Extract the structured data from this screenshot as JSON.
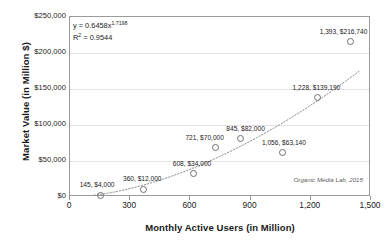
{
  "chart_data": {
    "type": "scatter",
    "title": "",
    "xlabel": "Monthly Active Users (in Million)",
    "ylabel": "Market Value (in Million $)",
    "xlim": [
      0,
      1500
    ],
    "ylim": [
      0,
      250000
    ],
    "xticks": [
      "0",
      "300",
      "600",
      "900",
      "1,200",
      "1,500"
    ],
    "xtick_values": [
      0,
      300,
      600,
      900,
      1200,
      1500
    ],
    "yticks": [
      "$0",
      "$50,000",
      "$100,000",
      "$150,000",
      "$200,000",
      "$250,000"
    ],
    "ytick_values": [
      0,
      50000,
      100000,
      150000,
      200000,
      250000
    ],
    "grid": "horizontal",
    "legend": "none",
    "x": [
      145,
      360,
      608,
      721,
      845,
      1056,
      1228,
      1393
    ],
    "y": [
      4000,
      12000,
      34000,
      70000,
      82000,
      63140,
      139190,
      216740
    ],
    "point_labels": [
      "145, $4,000",
      "360, $12,000",
      "608, $34,000",
      "721, $70,000",
      "845, $82,000",
      "1,056, $63,140",
      "1,228, $139,190",
      "1,393, $216,740"
    ],
    "trendline": {
      "type": "power",
      "coefficient": 0.6458,
      "exponent": 1.7198,
      "equation": "y = 0.6458x",
      "equation_exponent": "1.7198",
      "r_squared_label": "R",
      "r_squared_sup": "2",
      "r_squared_value": " = 0.9544",
      "style": "dotted"
    },
    "annotations": {
      "attribution": "Organic Media Lab, 2015"
    },
    "colors": {
      "point_stroke": "#6f6f6f",
      "trendline": "#8c8c8c",
      "grid": "#e3e3e3",
      "frame": "#9a9a9a",
      "text": "#1a1a1a"
    }
  }
}
